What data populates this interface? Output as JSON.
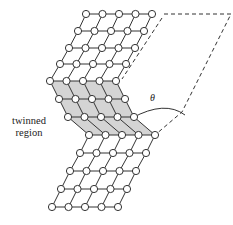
{
  "diagram": {
    "labels": {
      "twinned_line1": "twinned",
      "twinned_line2": "region",
      "angle": "θ"
    },
    "colors": {
      "line": "#333333",
      "node_fill": "#ffffff",
      "twin_fill": "#d4d4d4",
      "dashed": "#333333"
    },
    "lattice": {
      "columns": 5,
      "rows": [
        {
          "y": 14,
          "x0": 86,
          "region": "parent"
        },
        {
          "y": 31,
          "x0": 78,
          "region": "parent"
        },
        {
          "y": 48,
          "x0": 69,
          "region": "parent"
        },
        {
          "y": 64,
          "x0": 60,
          "region": "parent"
        },
        {
          "y": 81,
          "x0": 50,
          "region": "boundary"
        },
        {
          "y": 99,
          "x0": 59,
          "region": "twin"
        },
        {
          "y": 117,
          "x0": 68,
          "region": "twin"
        },
        {
          "y": 135,
          "x0": 89,
          "region": "boundary"
        },
        {
          "y": 153,
          "x0": 80,
          "region": "parent"
        },
        {
          "y": 171,
          "x0": 70,
          "region": "parent"
        },
        {
          "y": 189,
          "x0": 61,
          "region": "parent"
        },
        {
          "y": 207,
          "x0": 52,
          "region": "parent"
        }
      ],
      "spacing": 16.5
    }
  }
}
